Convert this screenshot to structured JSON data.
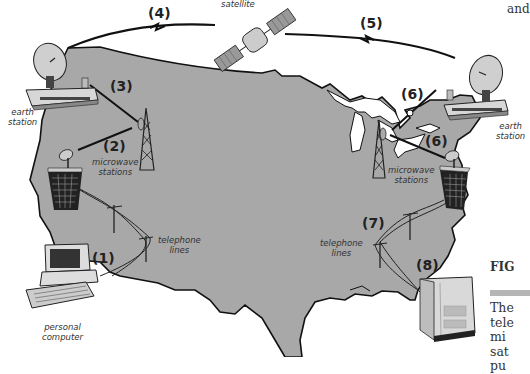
{
  "figure": {
    "colors": {
      "land": "#a8a8a8",
      "outline": "#111111",
      "background": "#ffffff",
      "device": "#d9d9d9"
    },
    "labels": {
      "satellite": "satellite",
      "earth_station_west_1": "earth",
      "earth_station_west_2": "station",
      "earth_station_east_1": "earth",
      "earth_station_east_2": "station",
      "microwave_west_1": "microwave",
      "microwave_west_2": "stations",
      "microwave_east_1": "microwave",
      "microwave_east_2": "stations",
      "telephone_west_1": "telephone",
      "telephone_west_2": "lines",
      "telephone_east_1": "telephone",
      "telephone_east_2": "lines",
      "pc_1": "personal",
      "pc_2": "computer"
    },
    "steps": [
      "(1)",
      "(2)",
      "(3)",
      "(4)",
      "(5)",
      "(6)",
      "(6)",
      "(7)",
      "(8)"
    ]
  },
  "sidebar": {
    "top_fragment": "and",
    "fig_fragment": "FIG",
    "text_lines": [
      "The",
      "tele",
      "mi",
      "sat",
      "pu"
    ]
  }
}
